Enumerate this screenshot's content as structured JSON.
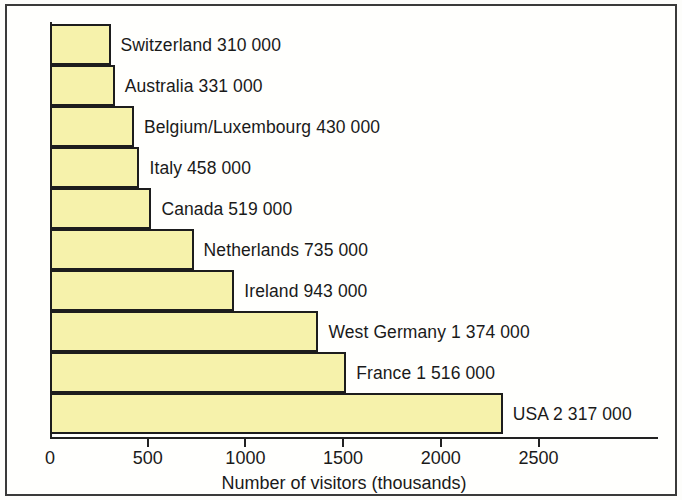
{
  "chart_data": {
    "type": "bar",
    "orientation": "horizontal",
    "title": "",
    "xlabel": "Number of visitors (thousands)",
    "ylabel": "Country of origin",
    "xlim": [
      0,
      3000
    ],
    "xticks": [
      0,
      500,
      1000,
      1500,
      2000,
      2500
    ],
    "xtick_labels": [
      "0",
      "500",
      "1000",
      "1500",
      "2000",
      "2500"
    ],
    "grid": false,
    "legend": false,
    "units_note": "values plotted in thousands; labels give full counts",
    "categories": [
      "Switzerland",
      "Australia",
      "Belgium/Luxembourg",
      "Italy",
      "Canada",
      "Netherlands",
      "Ireland",
      "West Germany",
      "France",
      "USA"
    ],
    "values": [
      310,
      331,
      430,
      458,
      519,
      735,
      943,
      1374,
      1516,
      2317
    ],
    "bars": [
      {
        "country": "Switzerland",
        "value": 310,
        "value_text": "310 000",
        "label": "Switzerland  310 000"
      },
      {
        "country": "Australia",
        "value": 331,
        "value_text": "331 000",
        "label": "Australia 331 000"
      },
      {
        "country": "Belgium/Luxembourg",
        "value": 430,
        "value_text": "430 000",
        "label": "Belgium/Luxembourg 430 000"
      },
      {
        "country": "Italy",
        "value": 458,
        "value_text": "458 000",
        "label": "Italy  458 000"
      },
      {
        "country": "Canada",
        "value": 519,
        "value_text": "519 000",
        "label": "Canada  519 000"
      },
      {
        "country": "Netherlands",
        "value": 735,
        "value_text": "735 000",
        "label": "Netherlands  735 000"
      },
      {
        "country": "Ireland",
        "value": 943,
        "value_text": "943 000",
        "label": "Ireland  943 000"
      },
      {
        "country": "West Germany",
        "value": 1374,
        "value_text": "1 374 000",
        "label": "West Germany  1 374 000"
      },
      {
        "country": "France",
        "value": 1516,
        "value_text": "1 516 000",
        "label": "France 1 516 000"
      },
      {
        "country": "USA",
        "value": 2317,
        "value_text": "2 317 000",
        "label": "USA  2 317 000"
      }
    ],
    "colors": {
      "bar_fill": "#f6f2ab",
      "bar_stroke": "#1d1d1d",
      "axis": "#222222",
      "text": "#1a1a1a",
      "frame": "#3a3a3a",
      "background": "#fffffd"
    }
  }
}
